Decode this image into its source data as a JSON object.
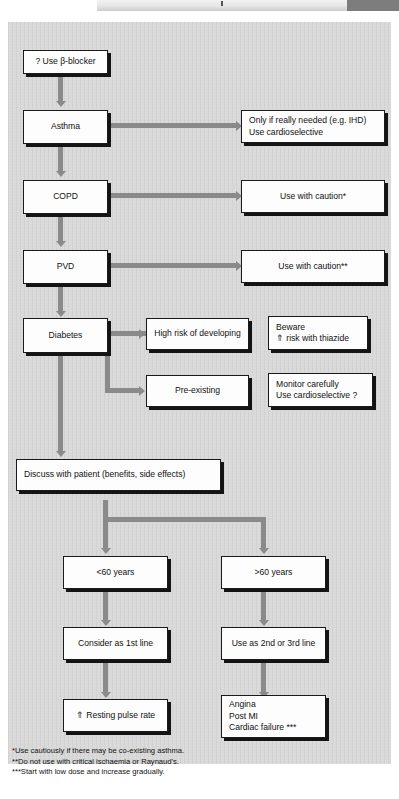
{
  "header": {
    "accent_color": "#7d7d7d",
    "strip_color": "#e6e6e6"
  },
  "panel": {
    "background_color": "#d9d9d9",
    "connector_color": "#8a8a8a",
    "box_border_color": "#1a1a1a"
  },
  "flowchart": {
    "title": "Beta-blocker prescribing decision flowchart",
    "nodes": {
      "start": {
        "label": "? Use β-blocker"
      },
      "asthma": {
        "label": "Asthma"
      },
      "asthma_action": {
        "line1": "Only if really needed (e.g. IHD)",
        "line2": "Use cardioselective"
      },
      "copd": {
        "label": "COPD"
      },
      "copd_action": {
        "label": "Use with caution*"
      },
      "pvd": {
        "label": "PVD"
      },
      "pvd_action": {
        "label": "Use with caution**"
      },
      "diabetes": {
        "label": "Diabetes"
      },
      "high_risk": {
        "label": "High risk of developing"
      },
      "high_risk_note": {
        "line1": "Beware",
        "line2": "⇑ risk with thiazide"
      },
      "pre_existing": {
        "label": "Pre-existing"
      },
      "pre_existing_note": {
        "line1": "Monitor carefully",
        "line2": "Use cardioselective ?"
      },
      "discuss": {
        "label": "Discuss with patient (benefits, side effects)"
      },
      "under60": {
        "label": "<60 years"
      },
      "over60": {
        "label": ">60 years"
      },
      "first_line": {
        "label": "Consider as 1st line"
      },
      "second_line": {
        "label": "Use as 2nd or 3rd line"
      },
      "pulse": {
        "label": "⇑ Resting pulse rate"
      },
      "indications": {
        "line1": "Angina",
        "line2": "Post MI",
        "line3": "Cardiac failure ***"
      }
    },
    "footnotes": {
      "one": "*Use cautiously if there may be co-existing asthma.",
      "two": "**Do not use with critical ischaemia or Raynaud's.",
      "three": "***Start with low dose and increase gradually."
    }
  }
}
